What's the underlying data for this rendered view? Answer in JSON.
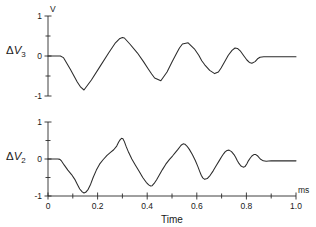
{
  "chart_data": {
    "type": "line",
    "title": "",
    "xlabel": "Time",
    "xunit": "ms",
    "yunit": "V",
    "xlim": [
      0,
      1.0
    ],
    "ylim": [
      -1,
      1
    ],
    "grid": false,
    "legend": "none",
    "x_ticks_major": [
      "0",
      "0.2",
      "0.4",
      "0.6",
      "0.8",
      "1.0"
    ],
    "x_tick_values_major": [
      0,
      0.2,
      0.4,
      0.6,
      0.8,
      1.0
    ],
    "x_tick_values_minor": [
      0.1,
      0.3,
      0.5,
      0.7,
      0.9
    ],
    "y_ticks_major": [
      "1",
      "0",
      "-1"
    ],
    "y_tick_values_major": [
      1,
      0,
      -1
    ],
    "y_tick_values_minor": [
      0.5,
      -0.5
    ],
    "panels": [
      {
        "name": "delta-v3",
        "label_prefix": "Δ",
        "label_symbol": "V",
        "label_subscript": "3",
        "label_text": "ΔV3",
        "waveform": "triangular decaying oscillation",
        "x": [
          0.0,
          0.02,
          0.04,
          0.05,
          0.062,
          0.09,
          0.118,
          0.132,
          0.145,
          0.175,
          0.21,
          0.245,
          0.272,
          0.288,
          0.3,
          0.308,
          0.33,
          0.36,
          0.385,
          0.405,
          0.418,
          0.43,
          0.455,
          0.48,
          0.5,
          0.518,
          0.53,
          0.542,
          0.565,
          0.59,
          0.608,
          0.62,
          0.632,
          0.652,
          0.672,
          0.687,
          0.698,
          0.71,
          0.727,
          0.742,
          0.754,
          0.764,
          0.775,
          0.79,
          0.802,
          0.812,
          0.822,
          0.835,
          0.845,
          0.855,
          0.87,
          0.9,
          0.94,
          1.0
        ],
        "y": [
          0.0,
          0.0,
          0.0,
          0.0,
          -0.04,
          -0.33,
          -0.65,
          -0.78,
          -0.85,
          -0.6,
          -0.26,
          0.08,
          0.33,
          0.43,
          0.46,
          0.45,
          0.3,
          0.08,
          -0.14,
          -0.33,
          -0.45,
          -0.55,
          -0.62,
          -0.4,
          -0.15,
          0.06,
          0.2,
          0.3,
          0.33,
          0.18,
          0.02,
          -0.12,
          -0.22,
          -0.36,
          -0.44,
          -0.4,
          -0.3,
          -0.17,
          0.02,
          0.14,
          0.2,
          0.19,
          0.13,
          0.0,
          -0.1,
          -0.16,
          -0.18,
          -0.14,
          -0.07,
          -0.03,
          -0.02,
          -0.02,
          -0.02,
          -0.02
        ]
      },
      {
        "name": "delta-v2",
        "label_prefix": "Δ",
        "label_symbol": "V",
        "label_subscript": "2",
        "label_text": "ΔV2",
        "waveform": "sawtooth decaying oscillation",
        "x": [
          0.0,
          0.02,
          0.04,
          0.048,
          0.055,
          0.065,
          0.08,
          0.095,
          0.108,
          0.118,
          0.128,
          0.138,
          0.145,
          0.152,
          0.162,
          0.172,
          0.182,
          0.195,
          0.208,
          0.222,
          0.238,
          0.252,
          0.265,
          0.277,
          0.285,
          0.292,
          0.297,
          0.302,
          0.308,
          0.315,
          0.325,
          0.338,
          0.352,
          0.368,
          0.382,
          0.396,
          0.406,
          0.414,
          0.42,
          0.428,
          0.438,
          0.45,
          0.462,
          0.475,
          0.49,
          0.502,
          0.514,
          0.524,
          0.532,
          0.538,
          0.545,
          0.552,
          0.56,
          0.57,
          0.582,
          0.594,
          0.604,
          0.612,
          0.618,
          0.624,
          0.632,
          0.642,
          0.654,
          0.666,
          0.678,
          0.69,
          0.7,
          0.708,
          0.715,
          0.722,
          0.73,
          0.74,
          0.75,
          0.757,
          0.763,
          0.77,
          0.778,
          0.787,
          0.795,
          0.802,
          0.808,
          0.815,
          0.822,
          0.83,
          0.838,
          0.846,
          0.856,
          0.868,
          0.88,
          0.9,
          0.93,
          0.96,
          1.0
        ],
        "y": [
          0.0,
          0.0,
          0.0,
          -0.01,
          -0.06,
          -0.16,
          -0.3,
          -0.42,
          -0.55,
          -0.68,
          -0.81,
          -0.89,
          -0.92,
          -0.9,
          -0.82,
          -0.68,
          -0.5,
          -0.3,
          -0.14,
          -0.02,
          0.1,
          0.18,
          0.25,
          0.35,
          0.46,
          0.53,
          0.56,
          0.55,
          0.47,
          0.34,
          0.18,
          0.0,
          -0.16,
          -0.34,
          -0.5,
          -0.63,
          -0.7,
          -0.73,
          -0.72,
          -0.66,
          -0.56,
          -0.42,
          -0.28,
          -0.14,
          -0.01,
          0.08,
          0.18,
          0.26,
          0.33,
          0.38,
          0.41,
          0.4,
          0.35,
          0.26,
          0.12,
          -0.04,
          -0.2,
          -0.34,
          -0.44,
          -0.51,
          -0.55,
          -0.53,
          -0.44,
          -0.32,
          -0.18,
          -0.05,
          0.06,
          0.14,
          0.2,
          0.23,
          0.24,
          0.2,
          0.12,
          0.04,
          -0.04,
          -0.12,
          -0.19,
          -0.22,
          -0.2,
          -0.13,
          -0.05,
          0.02,
          0.08,
          0.12,
          0.12,
          0.08,
          0.0,
          -0.05,
          -0.06,
          -0.05,
          -0.05,
          -0.05,
          -0.05
        ]
      }
    ]
  }
}
